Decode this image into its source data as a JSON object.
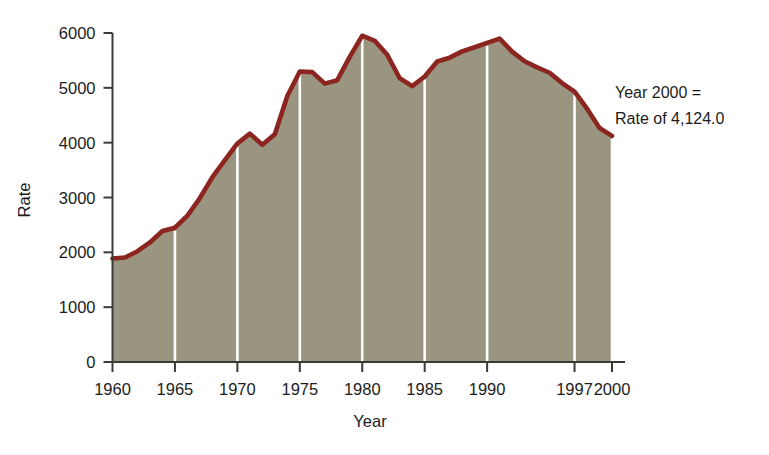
{
  "figure": {
    "background": "#ffffff",
    "cropped_caption_remnant": ""
  },
  "annotation": {
    "line1": "Year 2000 =",
    "line2": "Rate of 4,124.0"
  },
  "style": {
    "line_color": "#8c2420",
    "fill_color": "#9a9580",
    "gridline_color": "#ffffff",
    "axis_color": "#3a3a36",
    "text_color": "#1c1c1c"
  },
  "chart_data": {
    "type": "area",
    "title": "",
    "subtitle": "",
    "xlabel": "Year",
    "ylabel": "Rate",
    "xlim": [
      1960,
      2000
    ],
    "ylim": [
      0,
      6000
    ],
    "ytick_labels": [
      "0",
      "1000",
      "2000",
      "3000",
      "4000",
      "5000",
      "6000"
    ],
    "yticks": [
      0,
      1000,
      2000,
      3000,
      4000,
      5000,
      6000
    ],
    "xtick_labels": [
      "1960",
      "1965",
      "1970",
      "1975",
      "1980",
      "1985",
      "1990",
      "1997",
      "2000"
    ],
    "xticks": [
      1960,
      1965,
      1970,
      1975,
      1980,
      1985,
      1990,
      1997,
      2000
    ],
    "gridlines": {
      "vertical_at": [
        1965,
        1970,
        1975,
        1980,
        1985,
        1990,
        1997,
        2000
      ],
      "horizontal": false
    },
    "legend": null,
    "series": [
      {
        "name": "Rate",
        "x": [
          1960,
          1961,
          1962,
          1963,
          1964,
          1965,
          1966,
          1967,
          1968,
          1969,
          1970,
          1971,
          1972,
          1973,
          1974,
          1975,
          1976,
          1977,
          1978,
          1979,
          1980,
          1981,
          1982,
          1983,
          1984,
          1985,
          1986,
          1987,
          1988,
          1989,
          1990,
          1991,
          1992,
          1993,
          1994,
          1995,
          1996,
          1997,
          1998,
          1999,
          2000
        ],
        "values": [
          1887,
          1906,
          2020,
          2180,
          2388,
          2449,
          2671,
          2990,
          3370,
          3680,
          3985,
          4165,
          3961,
          4155,
          4850,
          5299,
          5287,
          5077,
          5140,
          5565,
          5950,
          5858,
          5604,
          5175,
          5031,
          5207,
          5480,
          5550,
          5664,
          5741,
          5820,
          5898,
          5660,
          5484,
          5374,
          5275,
          5087,
          4930,
          4620,
          4267,
          4124
        ]
      }
    ],
    "annotations": [
      {
        "text": "Year 2000 = Rate of 4,124.0",
        "x": 2000,
        "y": 4124
      }
    ]
  }
}
